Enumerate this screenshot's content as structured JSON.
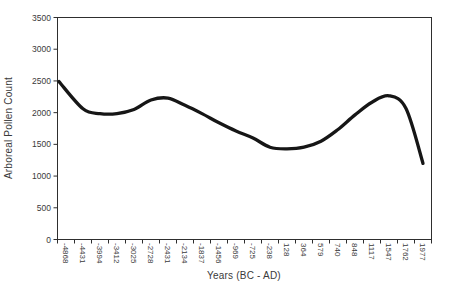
{
  "window": {
    "width": 452,
    "height": 298,
    "background": "#ffffff"
  },
  "chart_data": {
    "type": "line",
    "smoothed": true,
    "title": "",
    "xlabel": "Years (BC - AD)",
    "ylabel": "Arboreal Pollen Count",
    "categories": [
      "-4868",
      "-4431",
      "-3994",
      "-3412",
      "-3025",
      "-2728",
      "-2431",
      "-2134",
      "-1837",
      "-1456",
      "-969",
      "-725",
      "-238",
      "128",
      "364",
      "579",
      "740",
      "848",
      "1117",
      "1547",
      "1762",
      "1977"
    ],
    "series": [
      {
        "name": "Arboreal Pollen Count",
        "color": "#161616",
        "values": [
          2490,
          2060,
          1985,
          1985,
          2050,
          2200,
          2230,
          2115,
          1985,
          1840,
          1710,
          1600,
          1455,
          1430,
          1455,
          1550,
          1735,
          1965,
          2165,
          2265,
          2065,
          1200
        ]
      }
    ],
    "ylim": [
      0,
      3500
    ],
    "ytick_interval": 500,
    "yticks": [
      0,
      500,
      1000,
      1500,
      2000,
      2500,
      3000,
      3500
    ],
    "grid": false,
    "legend_position": "none",
    "x_labels_rotated_deg": 90,
    "first_point_on_axis": true,
    "axis_color": "#2e2e2e",
    "label_color": "#3a3a3a",
    "line_width": 3.3
  }
}
